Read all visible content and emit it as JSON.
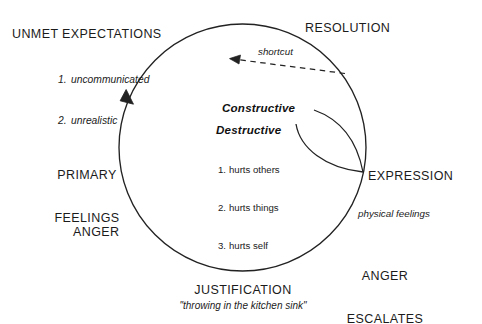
{
  "diagram": {
    "type": "cycle-diagram",
    "stroke_color": "#222222",
    "background_color": "#ffffff"
  },
  "nodes": {
    "unmet_expectations": {
      "label": "UNMET EXPECTATIONS",
      "items": [
        {
          "number": "1.",
          "text": "uncommunicated"
        },
        {
          "number": "2.",
          "text": "unrealistic"
        }
      ]
    },
    "resolution": {
      "label": "RESOLUTION"
    },
    "primary_feelings": {
      "line1": "PRIMARY",
      "line2": "FEELINGS"
    },
    "anger": {
      "label": "ANGER"
    },
    "justification": {
      "label": "JUSTIFICATION",
      "quote": "\"throwing in the kitchen sink\""
    },
    "anger_escalates": {
      "line1": "ANGER",
      "line2": "ESCALATES"
    },
    "expression": {
      "label": "EXPRESSION"
    },
    "physical_feelings": {
      "label": "physical feelings"
    }
  },
  "branches": {
    "constructive": {
      "label": "Constructive"
    },
    "destructive": {
      "label": "Destructive",
      "items": [
        {
          "number": "1.",
          "text": "hurts others"
        },
        {
          "number": "2.",
          "text": "hurts things"
        },
        {
          "number": "3.",
          "text": "hurts self"
        }
      ]
    }
  },
  "shortcut": {
    "label": "shortcut"
  }
}
